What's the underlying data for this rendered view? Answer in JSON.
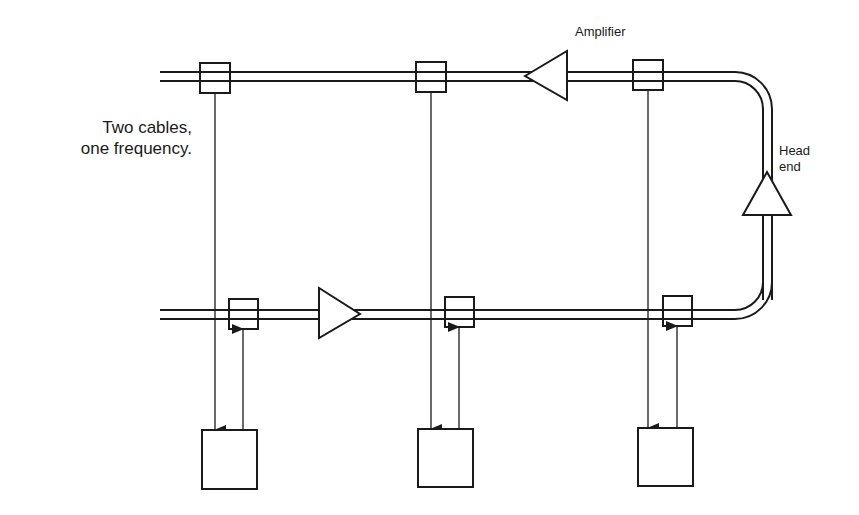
{
  "diagram": {
    "title": "Two cables, one frequency.",
    "labels": {
      "caption_line1": "Two cables,",
      "caption_line2": "one frequency.",
      "amplifier": "Amplifier",
      "head_end_line1": "Head",
      "head_end_line2": "end"
    },
    "colors": {
      "stroke": "#1a1a1a",
      "background": "#ffffff"
    },
    "cables": [
      {
        "id": "outbound",
        "position": "top",
        "direction": "right-to-left",
        "taps": 3,
        "amplifiers": 1
      },
      {
        "id": "inbound",
        "position": "bottom",
        "direction": "left-to-right",
        "taps": 3,
        "amplifiers": 1
      }
    ],
    "head_end": {
      "amplifier": 1,
      "direction": "up"
    },
    "stations": [
      {
        "id": "station-1",
        "receive_from": "top-tap-1",
        "send_to": "bottom-tap-1"
      },
      {
        "id": "station-2",
        "receive_from": "top-tap-2",
        "send_to": "bottom-tap-2"
      },
      {
        "id": "station-3",
        "receive_from": "top-tap-3",
        "send_to": "bottom-tap-3"
      }
    ]
  }
}
